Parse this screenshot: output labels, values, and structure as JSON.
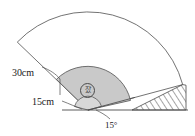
{
  "figure": {
    "type": "geometry-diagram",
    "labels": {
      "outer_radius": "30cm",
      "inner_radius": "15cm",
      "rotation_angle": "15°",
      "region_marker": "잤"
    },
    "colors": {
      "sector_fill": "#c9c9c9",
      "inner_fill": "#d6d6d6",
      "outline": "#555555",
      "hatch": "#3a3a3a",
      "background": "#ffffff",
      "text": "#1a1a1a"
    },
    "geometry": {
      "vertex_x": 88,
      "vertex_y": 110,
      "baseline_y": 110,
      "outer_radius_px": 98,
      "inner_radius_px": 44,
      "small_radius_px": 14,
      "sector_start_deg": 15,
      "sector_end_deg": 128
    }
  }
}
